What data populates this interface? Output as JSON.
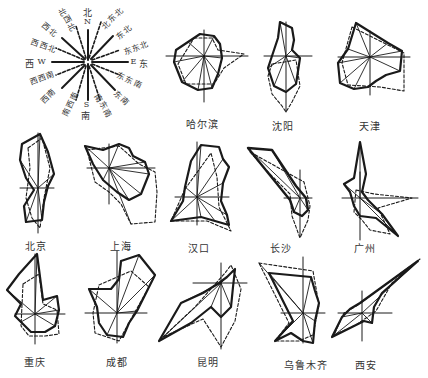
{
  "legend": {
    "directions": [
      {
        "cn": "北",
        "en": "N",
        "angle": 0
      },
      {
        "cn": "北东北",
        "angle": 22.5
      },
      {
        "cn": "东北",
        "angle": 45
      },
      {
        "cn": "东东北",
        "angle": 67.5
      },
      {
        "cn": "东",
        "en": "E",
        "angle": 90
      },
      {
        "cn": "东东南",
        "angle": 112.5
      },
      {
        "cn": "东南",
        "angle": 135
      },
      {
        "cn": "南东南",
        "angle": 157.5
      },
      {
        "cn": "南",
        "en": "S",
        "angle": 180
      },
      {
        "cn": "南西南",
        "angle": 202.5
      },
      {
        "cn": "西南",
        "angle": 225
      },
      {
        "cn": "西西南",
        "angle": 247.5
      },
      {
        "cn": "西",
        "en": "W",
        "angle": 270
      },
      {
        "cn": "西西北",
        "angle": 292.5
      },
      {
        "cn": "西北",
        "angle": 315
      },
      {
        "cn": "北西北",
        "angle": 337.5
      }
    ],
    "labels": {
      "n": "北",
      "n_en": "N",
      "nne": "北东北",
      "ne": "东北",
      "ene": "东东北",
      "e": "东",
      "e_en": "E",
      "ese": "东东南",
      "se": "东南",
      "sse": "南东南",
      "s": "南",
      "s_en": "S",
      "ssw": "南西南",
      "sw": "西南",
      "wsw": "西西南",
      "w": "西",
      "w_en": "W",
      "wnw": "西西北",
      "nw": "西北",
      "nnw": "北西北"
    }
  },
  "line_styles": {
    "solid": "annual/winter frequency (solid)",
    "dashed": "summer frequency (dashed)"
  },
  "cities": [
    {
      "name": "哈尔滨",
      "row": 1
    },
    {
      "name": "沈阳",
      "row": 1
    },
    {
      "name": "天津",
      "row": 1
    },
    {
      "name": "北京",
      "row": 2
    },
    {
      "name": "上海",
      "row": 2
    },
    {
      "name": "汉口",
      "row": 2
    },
    {
      "name": "长沙",
      "row": 2
    },
    {
      "name": "广州",
      "row": 2
    },
    {
      "name": "重庆",
      "row": 3
    },
    {
      "name": "成都",
      "row": 3
    },
    {
      "name": "昆明",
      "row": 3
    },
    {
      "name": "乌鲁木齐",
      "row": 3
    },
    {
      "name": "西安",
      "row": 3
    }
  ],
  "colors": {
    "ink": "#1a1a1a",
    "background": "#ffffff"
  }
}
